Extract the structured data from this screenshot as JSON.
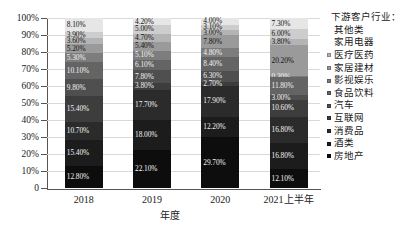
{
  "chart_data": {
    "type": "bar",
    "subtype": "stacked-percent-column",
    "title": "",
    "xlabel": "年度",
    "ylabel": "",
    "categories": [
      "2018",
      "2019",
      "2020",
      "2021上半年"
    ],
    "ylim": [
      0,
      100
    ],
    "yticks": [
      "0",
      "10%",
      "20%",
      "30%",
      "40%",
      "50%",
      "60%",
      "70%",
      "80%",
      "90%",
      "100%"
    ],
    "grid": true,
    "legend_position": "right",
    "legend_title": "下游客户行业：",
    "series": [
      {
        "name": "房地产",
        "color": "#0d0d0d",
        "values": [
          12.8,
          22.1,
          29.7,
          12.1
        ]
      },
      {
        "name": "酒类",
        "color": "#1c1c1c",
        "values": [
          15.4,
          18.0,
          12.2,
          16.8
        ]
      },
      {
        "name": "消费品",
        "color": "#2b2b2b",
        "values": [
          10.7,
          17.7,
          17.9,
          16.8
        ]
      },
      {
        "name": "互联网",
        "color": "#3d3d3d",
        "values": [
          15.4,
          3.8,
          2.7,
          10.6
        ]
      },
      {
        "name": "汽车",
        "color": "#4f4f4f",
        "values": [
          9.8,
          7.8,
          6.3,
          3.0
        ]
      },
      {
        "name": "食品饮料",
        "color": "#646464",
        "values": [
          10.1,
          6.1,
          8.4,
          11.8
        ]
      },
      {
        "name": "影视娱乐",
        "color": "#7d7d7d",
        "values": [
          5.3,
          5.1,
          4.8,
          0.3
        ]
      },
      {
        "name": "家居建材",
        "color": "#9a9a9a",
        "values": [
          5.2,
          5.4,
          7.8,
          20.2
        ]
      },
      {
        "name": "医疗医药",
        "color": "#b4b4b4",
        "values": [
          3.6,
          4.7,
          3.0,
          3.8
        ]
      },
      {
        "name": "家用电器",
        "color": "#cdcdcd",
        "values": [
          3.9,
          5.0,
          3.1,
          6.0
        ]
      },
      {
        "name": "其他类",
        "color": "#e6e6e6",
        "values": [
          8.1,
          4.2,
          4.0,
          7.3
        ]
      }
    ],
    "labels": {
      "2018": [
        "12.80%",
        "15.40%",
        "10.70%",
        "15.40%",
        "9.80%",
        "10.10%",
        "5.30%",
        "5.20%",
        "3.60%",
        "3.90%",
        "8.10%"
      ],
      "2019": [
        "22.10%",
        "18.00%",
        "17.70%",
        "3.80%",
        "7.80%",
        "6.10%",
        "5.10%",
        "5.40%",
        "4.70%",
        "5.00%",
        "4.20%"
      ],
      "2020": [
        "29.70%",
        "12.20%",
        "17.90%",
        "2.70%",
        "6.30%",
        "8.40%",
        "4.80%",
        "7.80%",
        "3.00%",
        "3.10%",
        "4.00%"
      ],
      "2021上半年": [
        "12.10%",
        "16.80%",
        "16.80%",
        "10.60%",
        "3.00%",
        "11.80%",
        "0.30%",
        "20.20%",
        "3.80%",
        "6.00%",
        "7.30%"
      ]
    }
  },
  "legend": {
    "title": "下游客户行业：",
    "items": [
      {
        "label": "其他类",
        "color": "#e6e6e6"
      },
      {
        "label": "家用电器",
        "color": "#cdcdcd"
      },
      {
        "label": "医疗医药",
        "color": "#b4b4b4"
      },
      {
        "label": "家居建材",
        "color": "#9a9a9a"
      },
      {
        "label": "影视娱乐",
        "color": "#7d7d7d"
      },
      {
        "label": "食品饮料",
        "color": "#646464"
      },
      {
        "label": "汽车",
        "color": "#4f4f4f"
      },
      {
        "label": "互联网",
        "color": "#3d3d3d"
      },
      {
        "label": "消费品",
        "color": "#2b2b2b"
      },
      {
        "label": "酒类",
        "color": "#1c1c1c"
      },
      {
        "label": "房地产",
        "color": "#0d0d0d"
      }
    ]
  }
}
